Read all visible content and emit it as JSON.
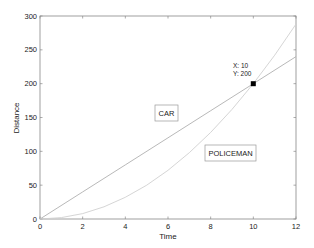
{
  "chart_data": {
    "type": "line",
    "title": "",
    "xlabel": "Time",
    "ylabel": "Distance",
    "xlim": [
      0,
      12
    ],
    "ylim": [
      0,
      300
    ],
    "xticks": [
      0,
      2,
      4,
      6,
      8,
      10,
      12
    ],
    "yticks": [
      0,
      50,
      100,
      150,
      200,
      250,
      300
    ],
    "grid": false,
    "legend": null,
    "series": [
      {
        "name": "CAR",
        "equation": "d = 20t",
        "x": [
          0,
          2,
          4,
          6,
          8,
          10,
          12
        ],
        "y": [
          0,
          40,
          80,
          120,
          160,
          200,
          240
        ],
        "color": "#b0b0b0"
      },
      {
        "name": "POLICEMAN",
        "equation": "d = 2t^2",
        "x": [
          0,
          1,
          2,
          3,
          4,
          5,
          6,
          7,
          8,
          9,
          10,
          11,
          12
        ],
        "y": [
          0,
          2,
          8,
          18,
          32,
          50,
          72,
          98,
          128,
          162,
          200,
          242,
          288
        ],
        "color": "#d0d0d0"
      }
    ],
    "annotations": [
      {
        "text": "CAR",
        "x": 5.75,
        "y": 158,
        "boxed": true
      },
      {
        "text": "POLICEMAN",
        "x": 8.8,
        "y": 100,
        "boxed": true
      }
    ],
    "datatip": {
      "x": 10,
      "y": 200,
      "label_x": "X: 10",
      "label_y": "Y: 200",
      "marker_color": "#000000"
    }
  },
  "labels": {
    "xlabel": "Time",
    "ylabel": "Distance",
    "car": "CAR",
    "policeman": "POLICEMAN",
    "tip_x": "X: 10",
    "tip_y": "Y: 200"
  }
}
